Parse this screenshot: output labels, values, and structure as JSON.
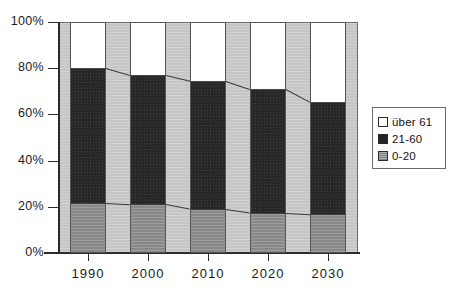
{
  "chart_data": {
    "type": "bar",
    "subtype": "stacked-100-percent-column",
    "title": "",
    "subtitle": "",
    "xlabel": "",
    "ylabel": "",
    "categories": [
      "1990",
      "2000",
      "2010",
      "2020",
      "2030"
    ],
    "series": [
      {
        "name": "0-20",
        "color": "#8f8f8f",
        "values": [
          21.5,
          21.0,
          19.0,
          17.5,
          17.0
        ]
      },
      {
        "name": "21-60",
        "color": "#272727",
        "values": [
          58.5,
          56.0,
          55.5,
          53.5,
          48.5
        ]
      },
      {
        "name": "über 61",
        "color": "#ffffff",
        "values": [
          20.0,
          23.0,
          25.5,
          29.0,
          34.5
        ]
      }
    ],
    "cumulative_tops": {
      "0-20": [
        21.5,
        21.0,
        19.0,
        17.5,
        17.0
      ],
      "21-60": [
        80.0,
        77.0,
        74.5,
        71.0,
        65.5
      ]
    },
    "ylim": [
      0,
      100
    ],
    "yticks": [
      "0%",
      "20%",
      "40%",
      "60%",
      "80%",
      "100%"
    ],
    "ytick_values": [
      0,
      20,
      40,
      60,
      80,
      100
    ],
    "xticks": [
      "1990",
      "2000",
      "2010",
      "2020",
      "2030"
    ],
    "grid": false,
    "legend_position": "right",
    "legend_entries": [
      "über 61",
      "21-60",
      "0-20"
    ],
    "plot_background": "#c9c9c9",
    "frame_color": "#6b6b6b"
  },
  "legend": {
    "items": [
      {
        "label": "über 61",
        "swatch": "white-swatch-icon"
      },
      {
        "label": "21-60",
        "swatch": "black-swatch-icon"
      },
      {
        "label": "0-20",
        "swatch": "gray-swatch-icon"
      }
    ]
  },
  "axes": {
    "y_labels": [
      "100%",
      "80%",
      "60%",
      "40%",
      "20%",
      "0%"
    ],
    "x_labels": [
      "1990",
      "2000",
      "2010",
      "2020",
      "2030"
    ]
  }
}
